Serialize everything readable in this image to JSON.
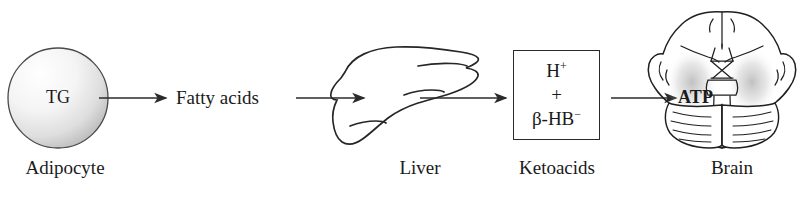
{
  "diagram": {
    "background_color": "#ffffff",
    "line_color": "#2a2a2a",
    "text_color": "#1a1a1a"
  },
  "nodes": {
    "adipocyte": {
      "inner_label": "TG",
      "caption": "Adipocyte",
      "shape": "shaded-sphere"
    },
    "fatty_acids": {
      "label": "Fatty acids"
    },
    "liver": {
      "caption": "Liver",
      "shape": "liver-outline"
    },
    "ketoacids": {
      "caption": "Ketoacids",
      "shape": "box",
      "formula_lines": [
        {
          "text": "H",
          "superscript": "+"
        },
        {
          "text": "+",
          "superscript": ""
        },
        {
          "text": "β-HB",
          "superscript": "−"
        }
      ]
    },
    "brain": {
      "caption": "Brain",
      "inner_label": "ATP",
      "shape": "brain-inferior-view"
    }
  },
  "arrows": [
    {
      "name": "arrow-tg-to-fatty-acids",
      "from": "adipocyte",
      "to": "fatty_acids"
    },
    {
      "name": "arrow-fatty-acids-to-liver",
      "from": "fatty_acids",
      "to": "liver"
    },
    {
      "name": "arrow-liver-to-ketoacids",
      "from": "liver",
      "to": "ketoacids"
    },
    {
      "name": "arrow-ketoacids-to-brain",
      "from": "ketoacids",
      "to": "brain"
    }
  ]
}
